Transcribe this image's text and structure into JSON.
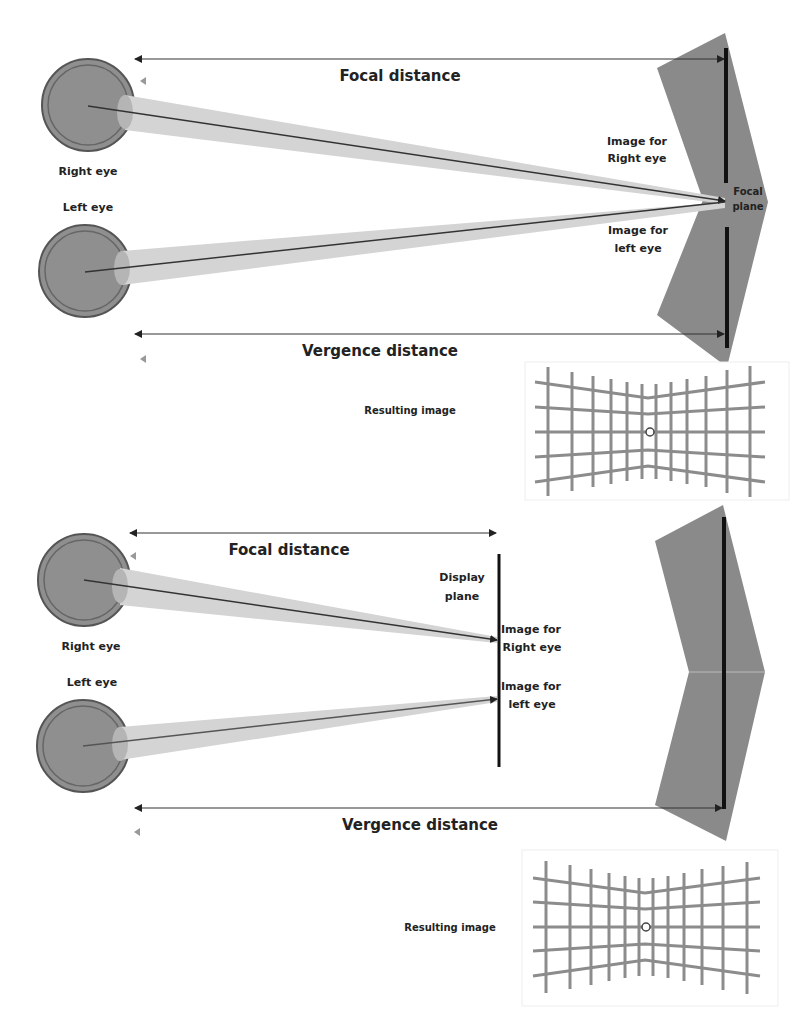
{
  "panels": [
    {
      "id": "top",
      "labels": {
        "focal_distance": "Focal distance",
        "vergence_distance": "Vergence distance",
        "right_eye": "Right eye",
        "left_eye": "Left eye",
        "image_right_1": "Image for",
        "image_right_2": "Right eye",
        "image_left_1": "Image for",
        "image_left_2": "left eye",
        "plane_1": "Focal",
        "plane_2": "plane",
        "resulting_image": "Resulting image"
      }
    },
    {
      "id": "bottom",
      "labels": {
        "focal_distance": "Focal distance",
        "vergence_distance": "Vergence distance",
        "right_eye": "Right eye",
        "left_eye": "Left eye",
        "image_right_1": "Image for",
        "image_right_2": "Right eye",
        "image_left_1": "Image for",
        "image_left_2": "left eye",
        "plane_1": "Display",
        "plane_2": "plane",
        "resulting_image": "Resulting image"
      }
    }
  ],
  "colors": {
    "eye_fill": "#8f8f8f",
    "beam": "#d4d4d4",
    "chevron": "#8a8a8a",
    "grid": "#8c8c8c",
    "line": "#333333"
  }
}
